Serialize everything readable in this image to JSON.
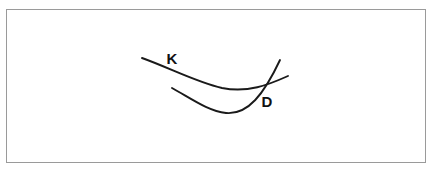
{
  "figure": {
    "background_color": "#ffffff",
    "frame": {
      "border_color": "#9a9a9a",
      "fill_color": "#ffffff"
    },
    "curves": [
      {
        "label": "K",
        "name": "curve-k",
        "color": "#1a1a1a",
        "stroke_width": 1.9,
        "description": "upper shallow convex curve descending from upper-left to a minimum then rising to the right",
        "path": "M 142 58 C 170 68, 196 82, 222 88 C 248 93, 268 85, 288 76",
        "label_x": 172,
        "label_y": 60
      },
      {
        "label": "D",
        "name": "curve-d",
        "color": "#1a1a1a",
        "stroke_width": 1.9,
        "description": "lower deeper convex curve descending from left to a lower minimum then rising steeply to the upper right",
        "path": "M 172 88 C 192 99, 208 111, 226 113 C 248 115, 264 94, 280 60",
        "label_x": 267,
        "label_y": 103
      }
    ],
    "intersection": {
      "x": 266,
      "y": 82
    }
  },
  "chart_data": {
    "type": "line",
    "title": "",
    "xlabel": "",
    "ylabel": "",
    "grid": false,
    "legend": "inline-labels",
    "series": [
      {
        "name": "K",
        "points": [
          [
            142,
            58
          ],
          [
            170,
            68
          ],
          [
            196,
            82
          ],
          [
            222,
            88
          ],
          [
            248,
            93
          ],
          [
            268,
            85
          ],
          [
            288,
            76
          ]
        ]
      },
      {
        "name": "D",
        "points": [
          [
            172,
            88
          ],
          [
            192,
            99
          ],
          [
            208,
            111
          ],
          [
            226,
            113
          ],
          [
            248,
            115
          ],
          [
            264,
            94
          ],
          [
            280,
            60
          ]
        ]
      }
    ]
  }
}
